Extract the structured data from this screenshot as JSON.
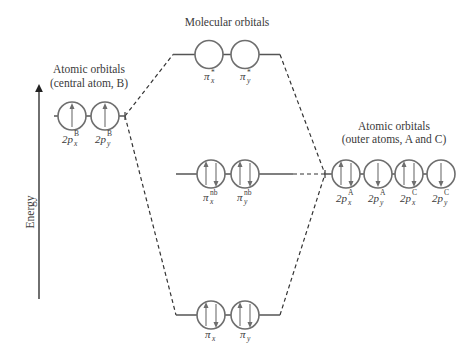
{
  "titles": {
    "molecular": "Molecular orbitals",
    "left_line1": "Atomic orbitals",
    "left_line2": "(central atom, B)",
    "right_line1": "Atomic orbitals",
    "right_line2": "(outer atoms, A and C)"
  },
  "axis": {
    "label": "Energy",
    "direction": "up"
  },
  "levels": {
    "central_atom": {
      "orbitals": [
        {
          "base": "2p",
          "sub": "x",
          "sup": "B",
          "electrons": [
            "up"
          ]
        },
        {
          "base": "2p",
          "sub": "y",
          "sup": "B",
          "electrons": [
            "up"
          ]
        }
      ]
    },
    "antibonding": {
      "orbitals": [
        {
          "base": "π",
          "sub": "x",
          "sup": "*",
          "electrons": []
        },
        {
          "base": "π",
          "sub": "y",
          "sup": "*",
          "electrons": []
        }
      ]
    },
    "nonbonding": {
      "orbitals": [
        {
          "base": "π",
          "sub": "x",
          "sup": "nb",
          "electrons": [
            "up",
            "down"
          ]
        },
        {
          "base": "π",
          "sub": "y",
          "sup": "nb",
          "electrons": [
            "up",
            "down"
          ]
        }
      ]
    },
    "bonding": {
      "orbitals": [
        {
          "base": "π",
          "sub": "x",
          "sup": "",
          "electrons": [
            "up",
            "down"
          ]
        },
        {
          "base": "π",
          "sub": "y",
          "sup": "",
          "electrons": [
            "up",
            "down"
          ]
        }
      ]
    },
    "outer_atoms": {
      "orbitals": [
        {
          "base": "2p",
          "sub": "x",
          "sup": "A",
          "electrons": [
            "up",
            "down"
          ]
        },
        {
          "base": "2p",
          "sub": "y",
          "sup": "A",
          "electrons": [
            "down"
          ]
        },
        {
          "base": "2p",
          "sub": "x",
          "sup": "C",
          "electrons": [
            "up",
            "down"
          ]
        },
        {
          "base": "2p",
          "sub": "y",
          "sup": "C",
          "electrons": [
            "down"
          ]
        }
      ]
    }
  },
  "colors": {
    "orbital_stroke": "#6e6e6e",
    "text": "#3a3a3a",
    "lines": "#333333"
  }
}
